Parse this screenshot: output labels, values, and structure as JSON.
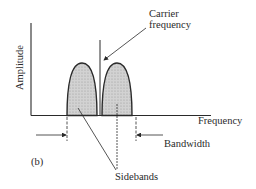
{
  "figure": {
    "panel_label": "(b)",
    "y_axis_label": "Amplitude",
    "x_axis_label": "Frequency",
    "annotations": {
      "carrier_line1": "Carrier",
      "carrier_line2": "frequency",
      "bandwidth": "Bandwidth",
      "sidebands": "Sidebands"
    },
    "colors": {
      "line": "#2a2a2a",
      "lobe_fill": "#c9c9c9",
      "background": "#ffffff"
    }
  }
}
